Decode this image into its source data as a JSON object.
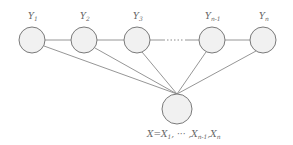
{
  "diagram": {
    "type": "graphical-model",
    "top_nodes": [
      {
        "id": "y1",
        "label": "Y",
        "sub": "1",
        "cx": 32,
        "cy": 40
      },
      {
        "id": "y2",
        "label": "Y",
        "sub": "2",
        "cx": 84,
        "cy": 40
      },
      {
        "id": "y3",
        "label": "Y",
        "sub": "3",
        "cx": 137,
        "cy": 40
      },
      {
        "id": "yn1",
        "label": "Y",
        "sub": "n-1",
        "cx": 212,
        "cy": 40
      },
      {
        "id": "yn",
        "label": "Y",
        "sub": "n",
        "cx": 263,
        "cy": 40
      }
    ],
    "ellipsis": "···",
    "bottom_node": {
      "id": "x",
      "cx": 177,
      "cy": 109,
      "label_parts": {
        "x": "X",
        "eq": "=",
        "x1": "X",
        "x1_sub": "1",
        "sep1": ", ··· ,",
        "xn1": "X",
        "xn1_sub": "n-1",
        "sep2": ",",
        "xn": "X",
        "xn_sub": "n"
      }
    },
    "colors": {
      "node_fill": "#f1f1f1",
      "node_stroke": "#7a7a7a",
      "edge": "#8a8a8a",
      "text": "#666666"
    }
  }
}
